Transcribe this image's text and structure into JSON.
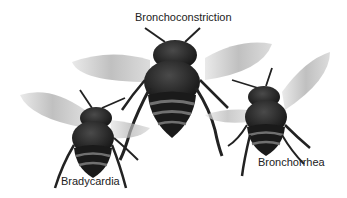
{
  "illustration": {
    "subject": "three flying bees",
    "colors": {
      "background": "#ffffff",
      "body": "#1f1f1f",
      "stripe": "#6a6a6a",
      "wing": "#bdbdbd",
      "label": "#222222"
    },
    "bees": [
      {
        "id": "center",
        "label": "Bronchoconstriction"
      },
      {
        "id": "left",
        "label": "Bradycardia"
      },
      {
        "id": "right",
        "label": "Bronchorrhea"
      }
    ]
  }
}
